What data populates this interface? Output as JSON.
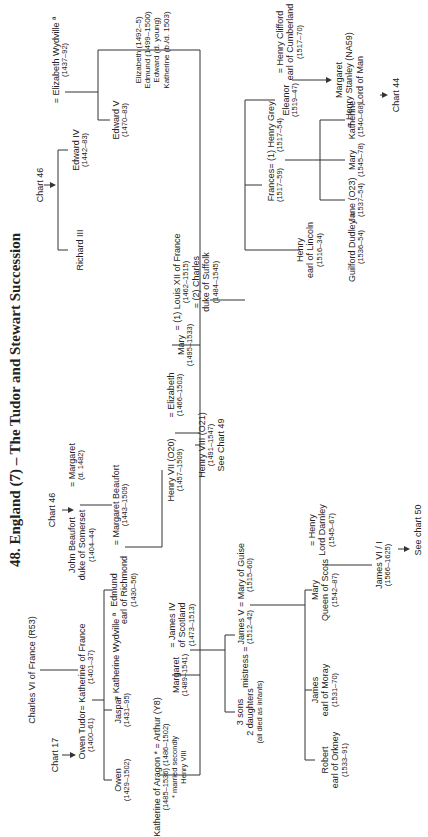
{
  "title": "48. England (7) – The Tudor and Stewart Succession",
  "refs": {
    "chart17": "Chart 17",
    "chart46_beaufort": "Chart 46",
    "chart46_york": "Chart 46",
    "chart44": "Chart 44",
    "chart49": "See Chart 49",
    "chart50": "See chart 50"
  },
  "people": {
    "charles6": {
      "name": "Charles VI of France (R53)"
    },
    "owen_tudor": {
      "name": "Owen Tudor",
      "dates": "(1400–61)"
    },
    "katherine_france": {
      "name": "= Katherine of France",
      "dates": "(1401–37)"
    },
    "john_beaufort": {
      "name": "John Beaufort",
      "name2": "duke of Somerset",
      "dates": "(1404–44)"
    },
    "margaret_1482": {
      "name": "= Margaret",
      "dates": "(d. 1482)"
    },
    "owen": {
      "name": "Owen",
      "dates": "(1429–1502)"
    },
    "jaspar": {
      "name": "Jaspar",
      "dates": "(1431–95)"
    },
    "katherine_wydville": {
      "name": "= Katherine Wydville ª"
    },
    "edmund": {
      "name": "Edmund",
      "name2": "earl of Richmond",
      "dates": "(1430–56)"
    },
    "margaret_beaufort": {
      "name": "= Margaret Beaufort",
      "dates": "(1443–1509)"
    },
    "henry7": {
      "name": "Henry VII (O20)",
      "dates": "(1457–1509)"
    },
    "elizabeth_york": {
      "name": "= Elizabeth",
      "dates": "(1466–1503)"
    },
    "richard3": {
      "name": "Richard III"
    },
    "edward4": {
      "name": "Edward IV",
      "dates": "(1442–83)"
    },
    "elizabeth_wydville": {
      "name": "= Elizabeth Wydville ª",
      "dates": "(1437–92)"
    },
    "edward5": {
      "name": "Edward V",
      "dates": "(1470–83)"
    },
    "katherine_aragon": {
      "name": "Katherine of Aragon * = Arthur (Y8)",
      "dates": "(1485–1536)        (1486–1502)",
      "note1": "* married secondly",
      "note2": "Henry VIII"
    },
    "margaret_tudor": {
      "name": "Margaret",
      "dates": "(1489–1541)"
    },
    "james4": {
      "name": "= James IV",
      "name2": "of Scotland",
      "dates": "(1473–1513)"
    },
    "henry8": {
      "name": "Henry VIII (O21)",
      "dates": "(1491–1547)"
    },
    "mary_tudor": {
      "name": "Mary",
      "dates": "(1495–1533)"
    },
    "louis12": {
      "name": "= (1) Louis XII of France",
      "dates": "(1462–1515)",
      "name2": "= (2) Charles",
      "name3": "duke of Suffolk",
      "dates2": "(1484–1545)"
    },
    "other_children": {
      "lines": [
        "Elizabeth (1492–5)",
        "Edmund (1499–1500)",
        "Edward (d. young)",
        "Katherine (b./d. 1503)"
      ]
    },
    "infants": {
      "name": "3 sons",
      "name2": "2 daughters",
      "note": "(all died as infants)"
    },
    "mistress": {
      "name": "mistress ="
    },
    "james5": {
      "name": "James V",
      "dates": "(1512–42)"
    },
    "mary_guise": {
      "name": "= Mary of Guise",
      "dates": "(1515–60)"
    },
    "robert": {
      "name": "Robert",
      "name2": "earl of Orkney",
      "dates": "(1533–91)"
    },
    "james_moray": {
      "name": "James",
      "name2": "earl of Moray",
      "dates": "(1531–70)"
    },
    "mary_qos": {
      "name": "Mary",
      "name2": "Queen of Scots",
      "dates": "(1542–87)"
    },
    "darnley": {
      "name": "= Henry",
      "name2": "Lord Darnley",
      "dates": "(1545–67)"
    },
    "james6": {
      "name": "James VI / I",
      "dates": "(1566–1625)"
    },
    "henry_lincoln": {
      "name": "Henry",
      "name2": "earl of Lincoln",
      "dates": "(1516–34)"
    },
    "frances": {
      "name": "Frances",
      "dates": "(1517–59)"
    },
    "henry_grey": {
      "name": "= (1) Henry Grey",
      "dates": "(1517–54)"
    },
    "eleanor": {
      "name": "Eleanor",
      "dates": "(1519–47)"
    },
    "henry_clifford": {
      "name": "= Henry Clifford",
      "name2": "earl of Cumberland",
      "dates": "(1517–70)"
    },
    "guilford": {
      "name": "Guilford Dudley =",
      "dates": "(1536–54)"
    },
    "jane": {
      "name": "Jane (O23)",
      "dates": "(1537–54)"
    },
    "mary_grey": {
      "name": "Mary",
      "dates": "(1545–78)"
    },
    "katherine_grey": {
      "name": "Katherine",
      "dates": "(1540–68)"
    },
    "margaret_stanley": {
      "name": "Margaret",
      "name2": "= Henry Stanley (NA59)",
      "name3": "Lord of Man"
    }
  }
}
